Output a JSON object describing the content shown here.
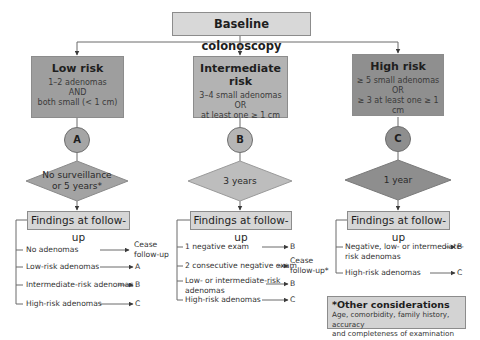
{
  "baseline": {
    "label": "Baseline colonoscopy"
  },
  "colors": {
    "low_risk": "#9e9e9e",
    "intermediate_risk": "#b3b3b3",
    "high_risk": "#8f8f8f",
    "light_box": "#d6d6d6",
    "line": "#5a5a5a"
  },
  "branches": [
    {
      "title": "Low risk",
      "criteria": [
        "1–2 adenomas",
        "AND",
        "both small (< 1 cm)"
      ],
      "marker": "A",
      "interval": [
        "No surveillance",
        "or 5 years*"
      ],
      "findings_title": "Findings at follow-up",
      "findings": [
        {
          "label": [
            "No adenomas"
          ],
          "result": [
            "Cease",
            "follow-up"
          ]
        },
        {
          "label": [
            "Low-risk adenomas"
          ],
          "result": [
            "A"
          ]
        },
        {
          "label": [
            "Intermediate-risk adenomas"
          ],
          "result": [
            "B"
          ]
        },
        {
          "label": [
            "High-risk adenomas"
          ],
          "result": [
            "C"
          ]
        }
      ]
    },
    {
      "title": "Intermediate risk",
      "criteria": [
        "3–4 small adenomas",
        "OR",
        "at least one ≥ 1 cm"
      ],
      "marker": "B",
      "interval": [
        "3 years"
      ],
      "findings_title": "Findings at follow-up",
      "findings": [
        {
          "label": [
            "1 negative exam"
          ],
          "result": [
            "B"
          ]
        },
        {
          "label": [
            "2 consecutive negative exam"
          ],
          "result": [
            "Cease",
            "follow-up*"
          ]
        },
        {
          "label": [
            "Low- or intermediate-risk",
            "adenomas"
          ],
          "result": [
            "B"
          ]
        },
        {
          "label": [
            "High-risk adenomas"
          ],
          "result": [
            "C"
          ]
        }
      ]
    },
    {
      "title": "High risk",
      "criteria": [
        "≥ 5 small adenomas",
        "OR",
        "≥ 3 at least one ≥ 1 cm"
      ],
      "marker": "C",
      "interval": [
        "1 year"
      ],
      "findings_title": "Findings at follow-up",
      "findings": [
        {
          "label": [
            "Negative, low- or intermediate-",
            "risk adenomas"
          ],
          "result": [
            "B"
          ]
        },
        {
          "label": [
            "High-risk adenomas"
          ],
          "result": [
            "C"
          ]
        }
      ]
    }
  ],
  "other_considerations": {
    "title": "*Other considerations",
    "text": [
      "Age, comorbidity, family history, accuracy",
      "and completeness of examination"
    ]
  }
}
